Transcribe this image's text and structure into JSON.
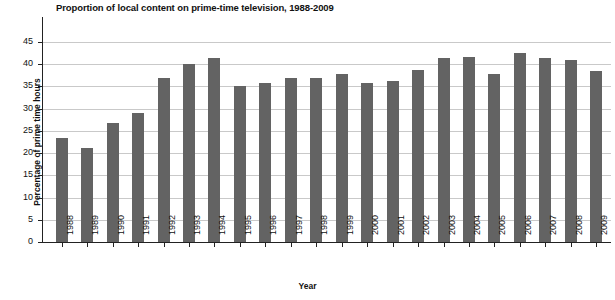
{
  "chart_data": {
    "type": "bar",
    "title": "Proportion of local content on prime-time television, 1988-2009",
    "xlabel": "Year",
    "ylabel": "Percentage of prime time hours",
    "categories": [
      "1988",
      "1989",
      "1990",
      "1991",
      "1992",
      "1993",
      "1994",
      "1995",
      "1996",
      "1997",
      "1998",
      "1999",
      "2000",
      "2001",
      "2002",
      "2003",
      "2004",
      "2005",
      "2006",
      "2007",
      "2008",
      "2009"
    ],
    "values": [
      23.3,
      21.2,
      26.8,
      29.0,
      37.0,
      40.0,
      41.3,
      35.0,
      35.8,
      36.8,
      36.9,
      37.9,
      35.7,
      36.3,
      38.8,
      41.5,
      41.6,
      37.7,
      42.5,
      41.5,
      41.0,
      38.4
    ],
    "ylim": [
      0,
      47
    ],
    "ytick_labels": [
      "0",
      "5",
      "10",
      "15",
      "20",
      "25",
      "30",
      "35",
      "40",
      "45"
    ],
    "ytick_values": [
      0,
      5,
      10,
      15,
      20,
      25,
      30,
      35,
      40,
      45
    ],
    "grid": true,
    "legend": null,
    "series_color": "#636363",
    "gridline_color": "#c9c9c9",
    "axis_color": "#222222"
  }
}
